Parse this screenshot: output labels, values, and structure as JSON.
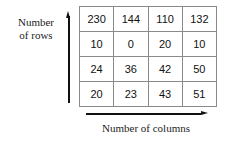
{
  "figure": {
    "y_axis": {
      "label_lines": [
        "Number",
        "of rows"
      ],
      "arrow_direction": "up",
      "arrow_icon": "arrow-up-icon"
    },
    "x_axis": {
      "label": "Number of columns",
      "arrow_direction": "right",
      "arrow_icon": "arrow-right-icon"
    },
    "colors": {
      "background": "#ffffff",
      "text": "#1d1d1d",
      "cell_text": "#111111",
      "grid_border": "#8a8a8a",
      "arrow": "#111111"
    }
  },
  "chart_data": {
    "type": "table",
    "title": "",
    "xlabel": "Number of columns",
    "ylabel": "Number of rows",
    "rows": 4,
    "columns": 4,
    "values": [
      [
        230,
        144,
        110,
        132
      ],
      [
        10,
        0,
        20,
        10
      ],
      [
        24,
        36,
        42,
        50
      ],
      [
        20,
        23,
        43,
        51
      ]
    ],
    "cells": {
      "r0c0": "230",
      "r0c1": "144",
      "r0c2": "110",
      "r0c3": "132",
      "r1c0": "10",
      "r1c1": "0",
      "r1c2": "20",
      "r1c3": "10",
      "r2c0": "24",
      "r2c1": "36",
      "r2c2": "42",
      "r2c3": "50",
      "r3c0": "20",
      "r3c1": "23",
      "r3c2": "43",
      "r3c3": "51"
    }
  }
}
